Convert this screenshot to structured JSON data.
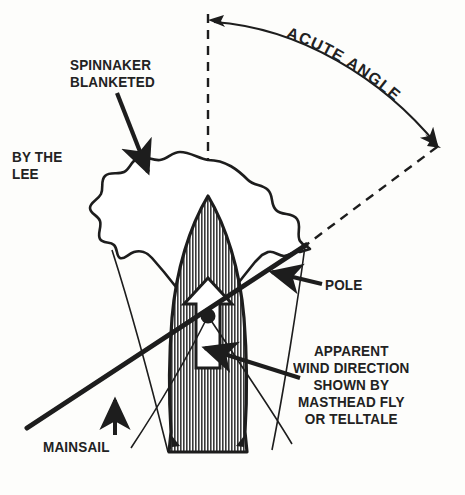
{
  "diagram": {
    "background_color": "#fdfdfb",
    "ink_color": "#1d1d1d",
    "labels": {
      "spinnaker_blanketed": "SPINNAKER\nBLANKETED",
      "by_the_lee": "BY THE\nLEE",
      "acute_angle": "ACUTE ANGLE",
      "pole": "POLE",
      "mainsail": "MAINSAIL",
      "apparent_wind": "APPARENT\nWIND DIRECTION\nSHOWN BY\nMASTHEAD FLY\nOR TELLTALE"
    },
    "elements": {
      "hull": "hull-hatched-vertical-stripes",
      "spinnaker": "scalloped-spinnaker-outline",
      "mast_dot": "mast-pivot-dot",
      "heading_arrow": "white-up-arrow-boat-heading",
      "wind_line": "thick-apparent-wind-line",
      "centerline": "dashed-vertical-centerline",
      "wind_ray": "dashed-diagonal-wind-ray",
      "angle_arc": "double-headed-arc-acute-angle",
      "mainsail_lines": "thin-mainsail-lines"
    }
  }
}
